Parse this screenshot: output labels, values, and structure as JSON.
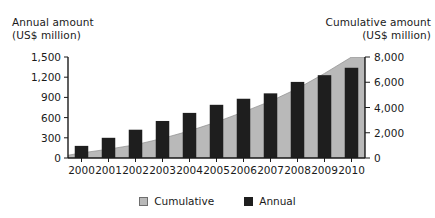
{
  "figure": {
    "left_axis_title": "Annual amount\n(US$ million)",
    "right_axis_title": "Cumulative amount\n(US$ million)",
    "top_artifact": "·"
  },
  "legend": {
    "items": [
      {
        "label": "Cumulative",
        "swatch": "legend-swatch-cumulative",
        "color": "#b9b9b9"
      },
      {
        "label": "Annual",
        "swatch": "legend-swatch-annual",
        "color": "#1e1e1e"
      }
    ]
  },
  "axes": {
    "left": {
      "tick_labels": [
        "1,500",
        "1,200",
        "900",
        "600",
        "300",
        "0"
      ],
      "tick_values": [
        1500,
        1200,
        900,
        600,
        300,
        0
      ]
    },
    "right": {
      "tick_labels": [
        "8,000",
        "6,000",
        "4,000",
        "2,000",
        "0"
      ],
      "tick_values": [
        8000,
        6000,
        4000,
        2000,
        0
      ]
    },
    "x": {
      "tick_labels": [
        "2000",
        "2001",
        "2002",
        "2003",
        "2004",
        "2005",
        "2006",
        "2007",
        "2008",
        "2009",
        "2010"
      ]
    }
  },
  "chart_data": {
    "type": "bar",
    "title": "",
    "xlabel": "",
    "ylabel": "Annual amount (US$ million)",
    "y2label": "Cumulative amount (US$ million)",
    "categories": [
      "2000",
      "2001",
      "2002",
      "2003",
      "2004",
      "2005",
      "2006",
      "2007",
      "2008",
      "2009",
      "2010"
    ],
    "series": [
      {
        "name": "Annual",
        "type": "bar",
        "axis": "left",
        "color": "#1e1e1e",
        "values": [
          180,
          300,
          420,
          550,
          670,
          790,
          880,
          960,
          1130,
          1230,
          1340
        ]
      },
      {
        "name": "Cumulative",
        "type": "area",
        "axis": "right",
        "color": "#b9b9b9",
        "values": [
          400,
          700,
          1050,
          1550,
          2150,
          2850,
          3650,
          4500,
          5500,
          6700,
          8000
        ]
      }
    ],
    "ylim": [
      0,
      1500
    ],
    "y2lim": [
      0,
      8000
    ],
    "grid": false,
    "legend_position": "bottom-center"
  }
}
